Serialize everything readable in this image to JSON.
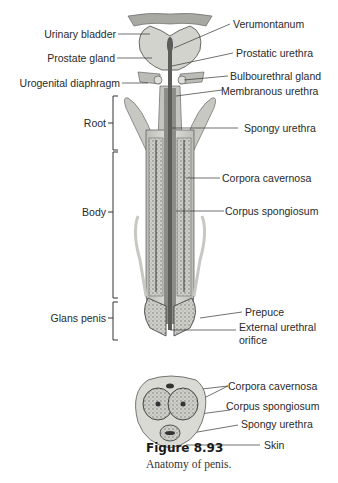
{
  "figure": {
    "number": "Figure 8.93",
    "caption": "Anatomy of penis."
  },
  "longitudinal_view": {
    "left_labels": {
      "urinary_bladder": "Urinary bladder",
      "prostate_gland": "Prostate gland",
      "urogenital_diaphragm": "Urogenital diaphragm"
    },
    "regions": {
      "root": "Root",
      "body": "Body",
      "glans_penis": "Glans penis"
    },
    "right_labels": {
      "verumontanum": "Verumontanum",
      "prostatic_urethra": "Prostatic urethra",
      "bulbourethral_gland": "Bulbourethral gland",
      "membranous_urethra": "Membranous urethra",
      "spongy_urethra": "Spongy urethra",
      "corpora_cavernosa": "Corpora cavernosa",
      "corpus_spongiosum": "Corpus spongiosum",
      "prepuce": "Prepuce",
      "external_urethral_orifice_line1": "External urethral",
      "external_urethral_orifice_line2": "orifice"
    }
  },
  "cross_section": {
    "labels": {
      "corpora_cavernosa": "Corpora cavernosa",
      "corpus_spongiosum": "Corpus spongiosum",
      "spongy_urethra": "Spongy urethra",
      "skin": "Skin"
    }
  },
  "colors": {
    "tissue_light": "#d9d9d4",
    "tissue_mid": "#b8b8b2",
    "tissue_dark": "#6e6e6a",
    "urethra": "#7a7a76",
    "outline": "#3a3a38",
    "leader": "#333333"
  }
}
